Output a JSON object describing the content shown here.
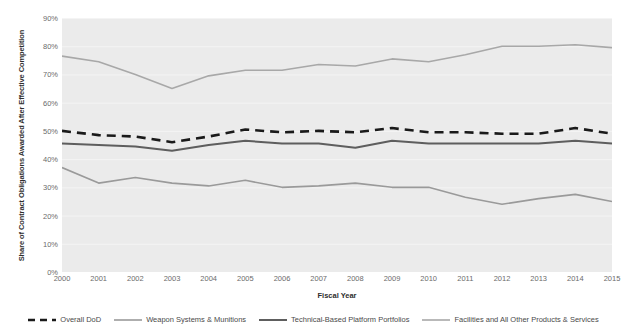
{
  "chart_data": {
    "type": "line",
    "title": "",
    "xlabel": "Fiscal Year",
    "ylabel": "Share of Contract Obligations Awarded After Effective Competition",
    "ylim": [
      0,
      90
    ],
    "ytick_labels": [
      "90%",
      "80%",
      "70%",
      "60%",
      "50%",
      "40%",
      "30%",
      "20%",
      "10%",
      "0%"
    ],
    "ytick_values": [
      90,
      80,
      70,
      60,
      50,
      40,
      30,
      20,
      10,
      0
    ],
    "grid": true,
    "legend_position": "bottom",
    "categories": [
      "2000",
      "2001",
      "2002",
      "2003",
      "2004",
      "2005",
      "2006",
      "2007",
      "2008",
      "2009",
      "2010",
      "2011",
      "2012",
      "2013",
      "2014",
      "2015"
    ],
    "series": [
      {
        "name": "Overall DoD",
        "style": "dashed",
        "color": "#1a1a1a",
        "width": 2.6,
        "values": [
          50.0,
          48.5,
          48.0,
          46.0,
          48.0,
          50.5,
          49.5,
          50.0,
          49.5,
          51.0,
          49.5,
          49.5,
          49.0,
          49.0,
          51.0,
          49.0
        ]
      },
      {
        "name": "Weapon Systems & Munitions",
        "style": "solid",
        "color": "#9a9a9a",
        "width": 1.6,
        "values": [
          37.0,
          31.5,
          33.5,
          31.5,
          30.5,
          32.5,
          30.0,
          30.5,
          31.5,
          30.0,
          30.0,
          26.5,
          24.0,
          26.0,
          27.5,
          25.0
        ]
      },
      {
        "name": "Technical-Based Platform Portfolios",
        "style": "solid",
        "color": "#5e5e5e",
        "width": 2.0,
        "values": [
          45.5,
          45.0,
          44.5,
          43.0,
          45.0,
          46.5,
          45.5,
          45.5,
          44.0,
          46.5,
          45.5,
          45.5,
          45.5,
          45.5,
          46.5,
          45.5
        ]
      },
      {
        "name": "Facilities and All Other Products & Services",
        "style": "solid",
        "color": "#a8a8a8",
        "width": 1.6,
        "values": [
          76.5,
          74.5,
          70.0,
          65.0,
          69.5,
          71.5,
          71.5,
          73.5,
          73.0,
          75.5,
          74.5,
          77.0,
          80.0,
          80.0,
          80.5,
          79.5
        ]
      }
    ]
  },
  "axes": {
    "x_title": "Fiscal Year",
    "y_title": "Share of Contract Obligations Awarded After Effective Competition"
  },
  "legend": {
    "items": [
      {
        "label": "Overall DoD",
        "swatch": "dashed-line-swatch"
      },
      {
        "label": "Weapon Systems & Munitions",
        "swatch": "solid-line-swatch"
      },
      {
        "label": "Technical-Based Platform Portfolios",
        "swatch": "solid-line-swatch"
      },
      {
        "label": "Facilities and All Other Products & Services",
        "swatch": "solid-line-swatch"
      }
    ]
  },
  "top_strip": {
    "cut_title": ""
  }
}
